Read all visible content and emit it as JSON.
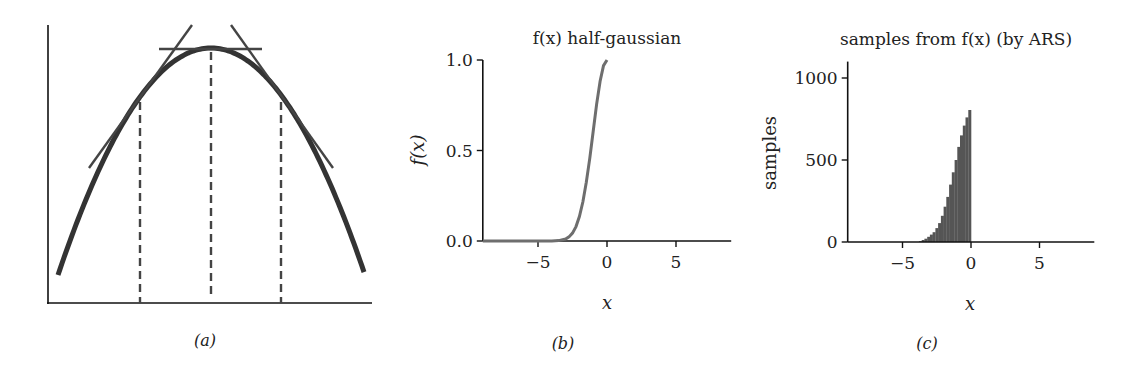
{
  "chart_data": [
    {
      "id": "a",
      "type": "line",
      "caption": "(a)",
      "title": "",
      "xlabel": "",
      "ylabel": "",
      "description": "Concave (log-concave) curve with three tangent lines at abscissae marked by dashed vertical lines",
      "grid": false,
      "curve_color": "#333333",
      "tangent_color": "#444444",
      "dashed_lines_x_rel": [
        -1,
        0,
        1
      ],
      "tangent_count": 3,
      "axes": {
        "origin_px": [
          48,
          303
        ],
        "x_end_px": 372,
        "y_top_px": 25
      },
      "curve_px": {
        "left_end": [
          58,
          275
        ],
        "peak": [
          211,
          48
        ],
        "right_end": [
          365,
          275
        ]
      },
      "tangents_px": [
        {
          "from": [
            89,
            168
          ],
          "to": [
            192,
            25
          ]
        },
        {
          "from": [
            159,
            49
          ],
          "to": [
            262,
            49
          ]
        },
        {
          "from": [
            231,
            25
          ],
          "to": [
            333,
            168
          ]
        }
      ],
      "dashed_px": [
        {
          "x": 140,
          "y_top": 102,
          "y_bottom": 303
        },
        {
          "x": 211,
          "y_top": 52,
          "y_bottom": 297
        },
        {
          "x": 281,
          "y_top": 102,
          "y_bottom": 303
        }
      ]
    },
    {
      "id": "b",
      "type": "line",
      "caption": "(b)",
      "title": "f(x) half-gaussian",
      "xlabel": "x",
      "ylabel": "f(x)",
      "xlim": [
        -9,
        9
      ],
      "ylim": [
        0,
        1.0
      ],
      "xticks": [
        -5,
        0,
        5
      ],
      "yticks": [
        0.0,
        0.5,
        1.0
      ],
      "ytick_labels": [
        "0.0",
        "0.5",
        "1.0"
      ],
      "xtick_labels": [
        "−5",
        "0",
        "5"
      ],
      "grid": false,
      "line_color": "#6e6e6e",
      "series": [
        {
          "name": "f(x)",
          "x": [
            -9,
            -6,
            -5,
            -4.5,
            -4,
            -3.5,
            -3,
            -2.75,
            -2.5,
            -2.25,
            -2,
            -1.75,
            -1.5,
            -1.25,
            -1,
            -0.75,
            -0.5,
            -0.25,
            0
          ],
          "y": [
            0.0,
            0.0,
            0.0,
            0.0,
            0.0003,
            0.0022,
            0.0111,
            0.0228,
            0.0439,
            0.0796,
            0.1353,
            0.2163,
            0.3247,
            0.4578,
            0.6065,
            0.7548,
            0.8825,
            0.9692,
            1.0
          ]
        }
      ]
    },
    {
      "id": "c",
      "type": "bar",
      "subtype": "histogram",
      "caption": "(c)",
      "title": "samples from f(x) (by ARS)",
      "xlabel": "x",
      "ylabel": "samples",
      "xlim": [
        -9,
        9
      ],
      "ylim": [
        0,
        1100
      ],
      "xticks": [
        -5,
        0,
        5
      ],
      "yticks": [
        0,
        500,
        1000
      ],
      "ytick_labels": [
        "0",
        "500",
        "1000"
      ],
      "xtick_labels": [
        "−5",
        "0",
        "5"
      ],
      "grid": false,
      "bar_color": "#555555",
      "bin_width": 0.2,
      "bin_left_edges": [
        -3.8,
        -3.6,
        -3.4,
        -3.2,
        -3.0,
        -2.8,
        -2.6,
        -2.4,
        -2.2,
        -2.0,
        -1.8,
        -1.6,
        -1.4,
        -1.2,
        -1.0,
        -0.8,
        -0.6,
        -0.4,
        -0.2
      ],
      "values": [
        5,
        12,
        20,
        32,
        45,
        60,
        85,
        115,
        160,
        215,
        275,
        350,
        425,
        500,
        580,
        650,
        710,
        760,
        805
      ]
    }
  ]
}
